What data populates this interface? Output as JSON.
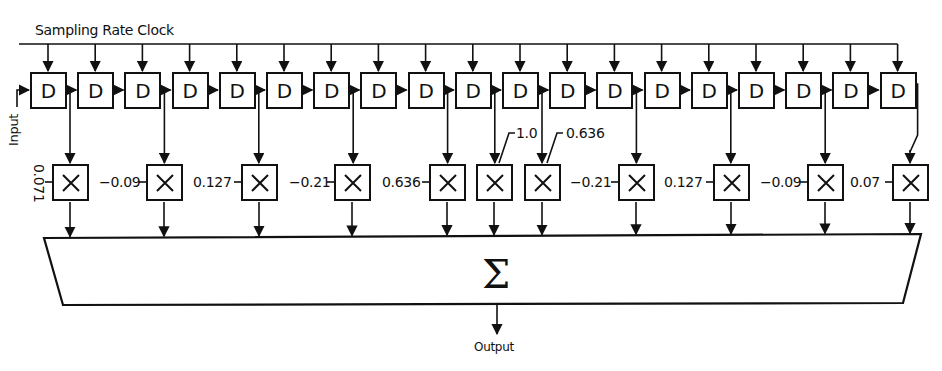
{
  "diagram": {
    "clock_label": "Sampling Rate Clock",
    "input_label": "Input",
    "output_label": "Output",
    "delay_symbol": "D",
    "delay_count": 19,
    "multiplier_symbol": "×",
    "sum_symbol": "Σ",
    "coefficients": [
      {
        "value": "0.071",
        "tap_after_delay": 1
      },
      {
        "value": "−0.09",
        "tap_after_delay": 3
      },
      {
        "value": "0.127",
        "tap_after_delay": 5
      },
      {
        "value": "−0.21",
        "tap_after_delay": 7
      },
      {
        "value": "0.636",
        "tap_after_delay": 9
      },
      {
        "value": "1.0",
        "tap_after_delay": 10
      },
      {
        "value": "0.636",
        "tap_after_delay": 11
      },
      {
        "value": "−0.21",
        "tap_after_delay": 13
      },
      {
        "value": "0.127",
        "tap_after_delay": 15
      },
      {
        "value": "−0.09",
        "tap_after_delay": 17
      },
      {
        "value": "0.07",
        "tap_after_delay": 19
      }
    ]
  },
  "labels": {
    "clock": "Sampling Rate Clock",
    "input": "Input",
    "output": "Output",
    "sum": "Σ",
    "d": "D",
    "coef": [
      "0.071",
      "−0.09",
      "0.127",
      "−0.21",
      "0.636",
      "1.0",
      "0.636",
      "−0.21",
      "0.127",
      "−0.09",
      "0.07"
    ]
  }
}
